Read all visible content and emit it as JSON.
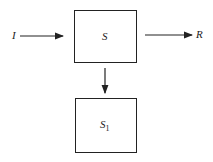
{
  "diagram": {
    "nodes": [
      {
        "id": "S",
        "label": "S"
      },
      {
        "id": "S1",
        "label": "S",
        "subscript": "1"
      }
    ],
    "edges": [
      {
        "from": "I",
        "to": "S"
      },
      {
        "from": "S",
        "to": "R"
      },
      {
        "from": "S",
        "to": "S1"
      }
    ],
    "input_label": "I",
    "output_label": "R"
  }
}
